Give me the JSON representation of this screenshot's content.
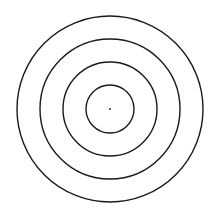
{
  "diagram": {
    "type": "concentric-circles",
    "background": "#ffffff",
    "stroke_color": "#1a1a1a",
    "stroke_width": 1.4,
    "center": {
      "x": 110,
      "y": 109
    },
    "radii": [
      24,
      47,
      70,
      93
    ],
    "center_dot_radius": 0.9
  }
}
